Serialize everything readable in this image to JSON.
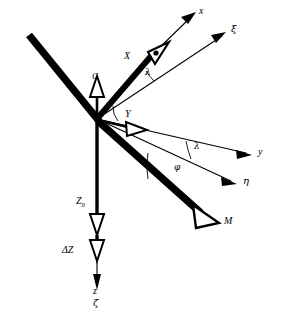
{
  "figure": {
    "background_color": "#ffffff",
    "stroke_color": "#000000",
    "width": 286,
    "height": 320
  },
  "origin": {
    "x": 97,
    "y": 119,
    "label": "origin"
  },
  "labels": {
    "axis_x": "x",
    "axis_xi": "ξ",
    "axis_y": "y",
    "axis_eta": "η",
    "axis_z": "z",
    "axis_zeta": "ζ",
    "force_X": "X",
    "force_Y": "Y",
    "force_Z0_base": "Z",
    "force_Z0_sub": "0",
    "force_dZ": "ΔZ",
    "point_C": "C",
    "point_M": "M",
    "angle_lambda_upper": "λ",
    "angle_lambda_lower": "λ",
    "angle_phi": "φ"
  },
  "vectors": [
    {
      "name": "thick-bar-upper-left",
      "type": "thick-line",
      "from": [
        30,
        36
      ],
      "to": [
        97,
        119
      ],
      "width": 7,
      "arrow": false
    },
    {
      "name": "force-X",
      "type": "thick-arrow",
      "from": [
        97,
        119
      ],
      "to": [
        158,
        48
      ],
      "width": 6,
      "arrow": true,
      "label": "X"
    },
    {
      "name": "force-M",
      "type": "thick-arrow",
      "from": [
        97,
        119
      ],
      "to": [
        207,
        217
      ],
      "width": 7,
      "arrow": true,
      "label": "M"
    },
    {
      "name": "force-C",
      "type": "thin-arrow",
      "from": [
        97,
        119
      ],
      "to": [
        97,
        90
      ],
      "width": 2,
      "arrow": true,
      "label": "C"
    },
    {
      "name": "force-Y",
      "type": "thin-arrow",
      "from": [
        97,
        119
      ],
      "to": [
        137,
        128
      ],
      "width": 2,
      "arrow": true,
      "label": "Y"
    },
    {
      "name": "force-Z0",
      "type": "thin-arrow",
      "from": [
        97,
        119
      ],
      "to": [
        97,
        232
      ],
      "width": 3,
      "arrow": true,
      "label": "Z0"
    },
    {
      "name": "force-deltaZ",
      "type": "thin-arrow",
      "from": [
        97,
        232
      ],
      "to": [
        97,
        258
      ],
      "width": 3,
      "arrow": true,
      "label": "dZ"
    },
    {
      "name": "axis-x",
      "type": "ray",
      "from": [
        150,
        57
      ],
      "to": [
        196,
        12
      ],
      "arrow": true
    },
    {
      "name": "axis-xi",
      "type": "ray",
      "from": [
        97,
        119
      ],
      "to": [
        228,
        32
      ],
      "arrow": true
    },
    {
      "name": "axis-y",
      "type": "ray",
      "from": [
        97,
        119
      ],
      "to": [
        252,
        155
      ],
      "arrow": true
    },
    {
      "name": "axis-eta",
      "type": "ray",
      "from": [
        97,
        119
      ],
      "to": [
        237,
        183
      ],
      "arrow": true
    },
    {
      "name": "axis-z-zeta",
      "type": "ray",
      "from": [
        97,
        258
      ],
      "to": [
        97,
        288
      ],
      "arrow": true
    }
  ],
  "angle_arcs": [
    {
      "name": "angle-lambda-upper",
      "label": "λ",
      "center": [
        97,
        119
      ],
      "between": [
        "force-X",
        "axis-xi"
      ]
    },
    {
      "name": "angle-lambda-lower",
      "label": "λ",
      "center": [
        97,
        119
      ],
      "between": [
        "axis-y",
        "axis-eta"
      ]
    },
    {
      "name": "angle-phi",
      "label": "φ",
      "center": [
        97,
        119
      ],
      "between": [
        "axis-eta",
        "force-M"
      ]
    }
  ]
}
